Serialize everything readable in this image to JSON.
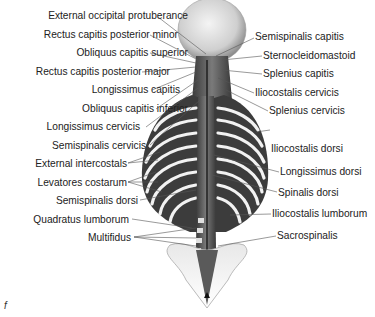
{
  "figure": {
    "letter": "f",
    "left_labels": [
      {
        "text": "External occipital protuberance",
        "right": 188,
        "top": 10
      },
      {
        "text": "Rectus capitis posterior minor",
        "right": 178,
        "top": 29
      },
      {
        "text": "Obliquus capitis superior",
        "right": 188,
        "top": 47
      },
      {
        "text": "Rectus capitis posterior major",
        "right": 170,
        "top": 66
      },
      {
        "text": "Longissimus capitis",
        "right": 180,
        "top": 84
      },
      {
        "text": "Obliquus capitis inferior",
        "right": 188,
        "top": 103
      },
      {
        "text": "Longissimus cervicis",
        "right": 180,
        "top": 122
      },
      {
        "text": "Semispinalis cervicis",
        "right": 185,
        "top": 140
      },
      {
        "text": "External intercostals",
        "right": 178,
        "top": 158
      },
      {
        "text": "Levatores costarum",
        "right": 180,
        "top": 177
      },
      {
        "text": "Semispinalis dorsi",
        "right": 178,
        "top": 195
      },
      {
        "text": "Quadratus lumborum",
        "right": 180,
        "top": 214
      },
      {
        "text": "Multifidus",
        "right": 178,
        "top": 232
      }
    ],
    "right_labels": [
      {
        "text": "Semispinalis capitis",
        "left": 255,
        "top": 30
      },
      {
        "text": "Sternocleidomastoid",
        "left": 263,
        "top": 48
      },
      {
        "text": "Splenius capitis",
        "left": 263,
        "top": 66
      },
      {
        "text": "Iliocostalis cervicis",
        "left": 255,
        "top": 85
      },
      {
        "text": "Splenius cervicis",
        "left": 269,
        "top": 103
      },
      {
        "text": "Iliocostalis dorsi",
        "left": 271,
        "top": 122
      },
      {
        "text": "Longissimus dorsi",
        "left": 280,
        "top": 166
      },
      {
        "text": "Spinalis dorsi",
        "left": 278,
        "top": 187
      },
      {
        "text": "Iliocostalis lumborum",
        "left": 272,
        "top": 208
      },
      {
        "text": "Sacrospinalis",
        "left": 277,
        "top": 230
      }
    ]
  }
}
